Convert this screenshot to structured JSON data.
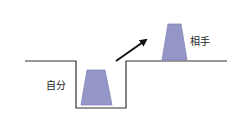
{
  "diagram": {
    "labels": {
      "self": "自分",
      "other": "相手"
    },
    "colors": {
      "shape_fill": "#9596c8",
      "shape_stroke": "#7f80b5",
      "line": "#333333",
      "arrow": "#111111"
    }
  }
}
